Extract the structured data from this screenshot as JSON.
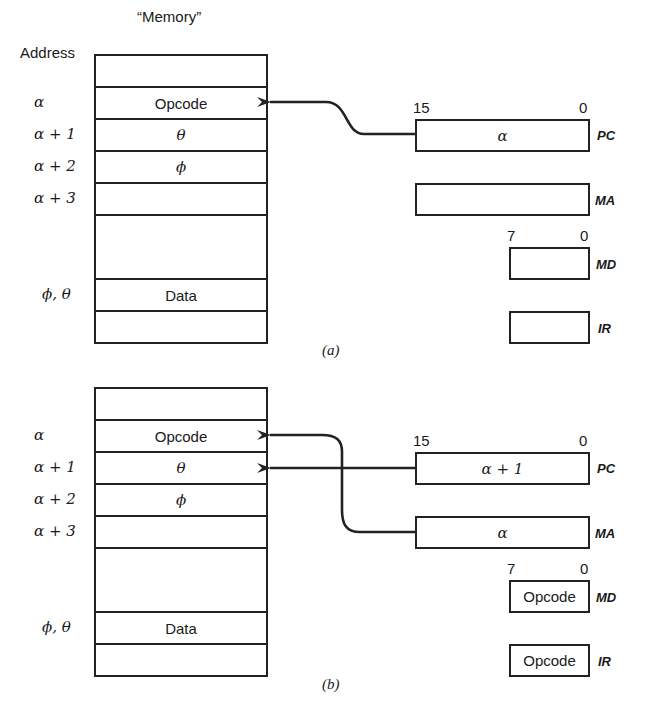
{
  "panel_a": {
    "header_memory": "“Memory”",
    "header_address": "Address",
    "memory_rows": [
      {
        "address": "",
        "content": "",
        "height": 32
      },
      {
        "address": "α",
        "content": "Opcode",
        "height": 32
      },
      {
        "address": "α + 1",
        "content": "θ",
        "height": 32
      },
      {
        "address": "α + 2",
        "content": "ϕ",
        "height": 32
      },
      {
        "address": "α + 3",
        "content": "",
        "height": 32
      },
      {
        "address": "",
        "content": "",
        "height": 64
      },
      {
        "address": "ϕ, θ",
        "content": "Data",
        "height": 32
      },
      {
        "address": "",
        "content": "",
        "height": 32
      }
    ],
    "registers": {
      "pc": {
        "name": "PC",
        "value": "α",
        "bit_high": "15",
        "bit_low": "0"
      },
      "ma": {
        "name": "MA",
        "value": ""
      },
      "md": {
        "name": "MD",
        "value": "",
        "bit_high": "7",
        "bit_low": "0"
      },
      "ir": {
        "name": "IR",
        "value": ""
      }
    },
    "caption": "(a)"
  },
  "panel_b": {
    "memory_rows": [
      {
        "address": "",
        "content": ""
      },
      {
        "address": "α",
        "content": "Opcode"
      },
      {
        "address": "α + 1",
        "content": "θ"
      },
      {
        "address": "α + 2",
        "content": "ϕ"
      },
      {
        "address": "α + 3",
        "content": ""
      },
      {
        "address": "",
        "content": ""
      },
      {
        "address": "ϕ, θ",
        "content": "Data"
      },
      {
        "address": "",
        "content": ""
      }
    ],
    "registers": {
      "pc": {
        "name": "PC",
        "value": "α + 1",
        "bit_high": "15",
        "bit_low": "0"
      },
      "ma": {
        "name": "MA",
        "value": "α"
      },
      "md": {
        "name": "MD",
        "value": "Opcode",
        "bit_high": "7",
        "bit_low": "0"
      },
      "ir": {
        "name": "IR",
        "value": "Opcode"
      }
    },
    "caption": "(b)"
  },
  "arrows": {
    "a": [
      {
        "from": "PC",
        "to": "α"
      }
    ],
    "b": [
      {
        "from": "MA",
        "to": "α"
      },
      {
        "from": "PC",
        "to": "α + 1"
      }
    ]
  },
  "colors": {
    "ink": "#222222",
    "background": "#ffffff"
  }
}
